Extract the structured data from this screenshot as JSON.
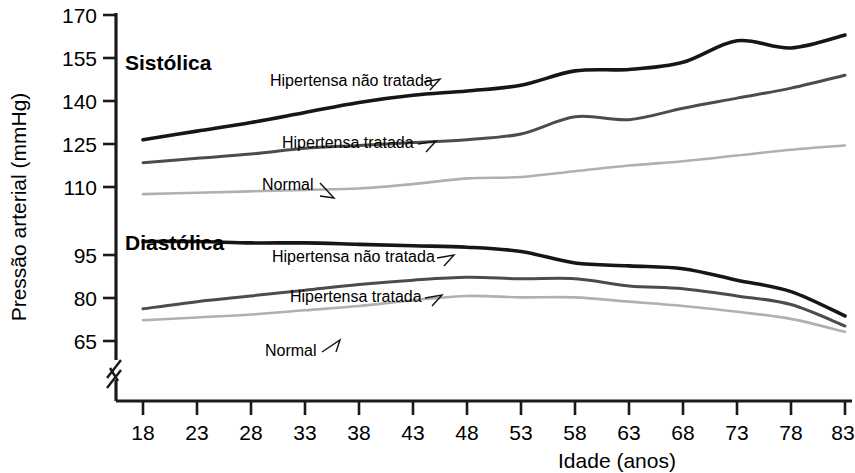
{
  "chart_data": {
    "type": "line",
    "title": "",
    "xlabel": "Idade (anos)",
    "ylabel": "Pressão arterial (mmHg)",
    "xlim": [
      18,
      83
    ],
    "ylim": [
      58,
      170
    ],
    "grid": false,
    "legend_position": "inline-labels",
    "x_ticks": [
      "18",
      "23",
      "28",
      "33",
      "38",
      "43",
      "48",
      "53",
      "58",
      "63",
      "68",
      "73",
      "78",
      "83"
    ],
    "y_ticks": [
      "170",
      "155",
      "140",
      "125",
      "110",
      "95",
      "80",
      "65"
    ],
    "axis_break": "y-axis broken below 65",
    "group_headings": [
      {
        "key": "systolic",
        "label": "Sistólica"
      },
      {
        "key": "diastolic",
        "label": "Diastólica"
      }
    ],
    "x": [
      18,
      23,
      28,
      33,
      38,
      43,
      48,
      53,
      58,
      63,
      68,
      73,
      78,
      83
    ],
    "series": [
      {
        "name": "Hipertensa não tratada",
        "group": "Sistólica",
        "color": "#161616",
        "width": 3.6,
        "values": [
          126.5,
          129.5,
          132.5,
          136.0,
          139.5,
          142.0,
          143.5,
          145.5,
          150.5,
          151.0,
          153.5,
          161.0,
          158.5,
          163.0
        ]
      },
      {
        "name": "Hipertensa tratada",
        "group": "Sistólica",
        "color": "#4c4c4c",
        "width": 3.0,
        "values": [
          118.5,
          120.0,
          121.5,
          123.5,
          124.5,
          125.5,
          126.5,
          128.5,
          134.5,
          133.5,
          137.5,
          141.0,
          144.5,
          149.0
        ]
      },
      {
        "name": "Normal",
        "group": "Sistólica",
        "color": "#b0b0b0",
        "width": 2.6,
        "values": [
          107.5,
          108.0,
          108.5,
          109.0,
          109.5,
          111.0,
          113.0,
          113.5,
          115.5,
          117.5,
          119.0,
          121.0,
          123.0,
          124.5
        ]
      },
      {
        "name": "Hipertensa não tratada",
        "group": "Diastólica",
        "color": "#161616",
        "width": 3.6,
        "values": [
          91.0,
          91.0,
          90.5,
          90.5,
          90.0,
          89.5,
          89.0,
          87.5,
          83.5,
          82.5,
          81.5,
          77.5,
          73.5,
          65.0
        ]
      },
      {
        "name": "Hipertensa tratada",
        "group": "Diastólica",
        "color": "#4c4c4c",
        "width": 3.0,
        "values": [
          67.5,
          70.0,
          72.0,
          74.0,
          76.0,
          77.5,
          78.5,
          78.0,
          78.0,
          75.5,
          74.5,
          72.0,
          69.0,
          61.5
        ]
      },
      {
        "name": "Normal",
        "group": "Diastólica",
        "color": "#b0b0b0",
        "width": 2.6,
        "values": [
          63.5,
          64.5,
          65.5,
          67.0,
          68.5,
          70.5,
          72.0,
          71.5,
          71.5,
          70.0,
          68.5,
          66.5,
          64.0,
          59.5
        ]
      }
    ],
    "annotations": [
      {
        "text": "Sistólica",
        "kind": "heading"
      },
      {
        "text": "Diastólica",
        "kind": "heading"
      },
      {
        "text": "Hipertensa não tratada",
        "kind": "series-callout",
        "group": "Sistólica"
      },
      {
        "text": "Hipertensa tratada",
        "kind": "series-callout",
        "group": "Sistólica"
      },
      {
        "text": "Normal",
        "kind": "series-callout",
        "group": "Sistólica"
      },
      {
        "text": "Hipertensa não tratada",
        "kind": "series-callout",
        "group": "Diastólica"
      },
      {
        "text": "Hipertensa tratada",
        "kind": "series-callout",
        "group": "Diastólica"
      },
      {
        "text": "Normal",
        "kind": "series-callout",
        "group": "Diastólica"
      }
    ]
  }
}
